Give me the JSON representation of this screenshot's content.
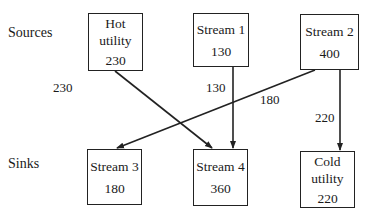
{
  "rows": {
    "sources_label": "Sources",
    "sinks_label": "Sinks"
  },
  "sources": [
    {
      "id": "hot-utility",
      "name": "Hot\nutility",
      "value": "230"
    },
    {
      "id": "stream-1",
      "name": "Stream 1",
      "value": "130"
    },
    {
      "id": "stream-2",
      "name": "Stream 2",
      "value": "400"
    }
  ],
  "sinks": [
    {
      "id": "stream-3",
      "name": "Stream 3",
      "value": "180"
    },
    {
      "id": "stream-4",
      "name": "Stream 4",
      "value": "360"
    },
    {
      "id": "cold-utility",
      "name": "Cold\nutility",
      "value": "220"
    }
  ],
  "flows": [
    {
      "from": "Hot utility",
      "to": "Stream 4",
      "label": "230"
    },
    {
      "from": "Stream 1",
      "to": "Stream 4",
      "label": "130"
    },
    {
      "from": "Stream 2",
      "to": "Stream 3",
      "label": "180"
    },
    {
      "from": "Stream 2",
      "to": "Cold utility",
      "label": "220"
    }
  ],
  "colors": {
    "line": "#222222",
    "background": "#ffffff"
  }
}
